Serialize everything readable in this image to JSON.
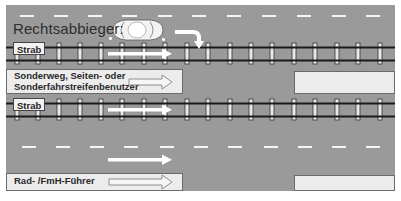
{
  "diagram": {
    "title": "Rechtsabbieger:",
    "tracks": [
      {
        "label": "Strab"
      },
      {
        "label": "Strab"
      }
    ],
    "lanes": {
      "special_path_label_line1": "Sonderweg, Seiten- oder",
      "special_path_label_line2": "Sonderfahrstreifenbenutzer",
      "bike_label": "Rad- /FmH-Führer"
    },
    "elements": {
      "car": "car-top-view",
      "turn_arrow": "right-turn-arrow",
      "straight_arrows": "straight-arrow"
    },
    "colors": {
      "road": "#9a9a9a",
      "marking": "#ffffff",
      "rail": "#1a1a1a",
      "box": "#ececec"
    }
  }
}
